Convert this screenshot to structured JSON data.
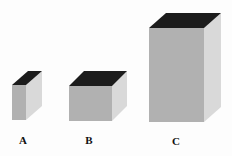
{
  "diagram": {
    "colors": {
      "top": "#1c1c1c",
      "front": "#b1b1b1",
      "side": "#d9d9d9",
      "background": "#fdfdfd"
    },
    "boxes": [
      {
        "label": "A",
        "front": {
          "x": 12,
          "y": 85,
          "w": 14,
          "h": 35
        },
        "depth": {
          "dx": 16,
          "dy": -14
        },
        "label_pos": {
          "x": 23,
          "y": 144
        }
      },
      {
        "label": "B",
        "front": {
          "x": 69,
          "y": 86,
          "w": 43,
          "h": 35
        },
        "depth": {
          "dx": 15,
          "dy": -15
        },
        "label_pos": {
          "x": 89,
          "y": 144
        }
      },
      {
        "label": "C",
        "front": {
          "x": 149,
          "y": 28,
          "w": 55,
          "h": 94
        },
        "depth": {
          "dx": 17,
          "dy": -15
        },
        "label_pos": {
          "x": 176,
          "y": 145
        }
      }
    ]
  }
}
